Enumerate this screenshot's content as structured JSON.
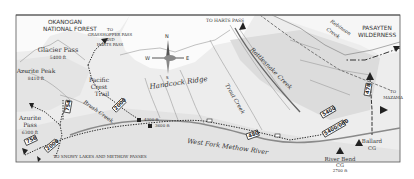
{
  "map": {
    "regions": {
      "okanogan": [
        "OKANOGAN",
        "NATIONAL FOREST"
      ],
      "pasayten": [
        "PASAYTEN",
        "WILDERNESS"
      ]
    },
    "peaks": [
      {
        "name": "Glacier Pass",
        "elev": "5400 ft"
      },
      {
        "name": "Azurite Peak",
        "elev": "8410 ft"
      },
      {
        "name": "Azurite",
        "name2": "Pass",
        "elev": "6300 ft"
      }
    ],
    "features": {
      "handcock_ridge": "Handcock Ridge",
      "pct": [
        "Pacific",
        "Crest",
        "Trail"
      ],
      "brush_creek": "Brush Creek",
      "trout_creek": "Trout Creek",
      "rattlesnake_creek": "Rattlesnake Creek",
      "robinson_creek": [
        "Robinson",
        "Creek"
      ],
      "west_fork": "West Fork Methow River"
    },
    "destinations": {
      "grasshopper": [
        "TO",
        "GRASSHOPPER PASS",
        "AND",
        "HARTS PASS"
      ],
      "harts": "TO HARTS PASS",
      "mazama": [
        "TO",
        "MAZAMA"
      ],
      "snowy": "TO SNOWY LAKES AND METHOW PASSES"
    },
    "elevations": {
      "e4300": "4300 ft",
      "e3600": "3600 ft"
    },
    "campgrounds": [
      {
        "name": "River Bend",
        "type": "CG",
        "elev": "2700 ft"
      },
      {
        "name": "Ballard",
        "type": "CG"
      }
    ],
    "trails": {
      "t756": "756",
      "t2000a": "2000",
      "t2000b": "2000",
      "t754": "754",
      "t480": "480",
      "t478": "478",
      "t5400": "5400",
      "t5400060": "5400/060"
    },
    "compass": {
      "n": "N",
      "s": "S",
      "e": "E",
      "w": "W"
    }
  }
}
